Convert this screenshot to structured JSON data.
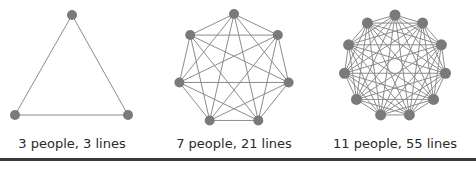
{
  "colors": {
    "node": "#7a7a7a",
    "edge": "#8c8c8c",
    "text": "#2a2a2a",
    "rule": "#3a3a3a"
  },
  "graphs": [
    {
      "people": 3,
      "lines": 3,
      "label": "3 people, 3 lines",
      "cx": 72,
      "cy": 72,
      "r": 57
    },
    {
      "people": 7,
      "lines": 21,
      "label": "7 people, 21 lines",
      "cx": 234,
      "cy": 70,
      "r": 56
    },
    {
      "people": 11,
      "lines": 55,
      "label": "11 people, 55 lines",
      "cx": 395,
      "cy": 66,
      "r": 51
    }
  ]
}
